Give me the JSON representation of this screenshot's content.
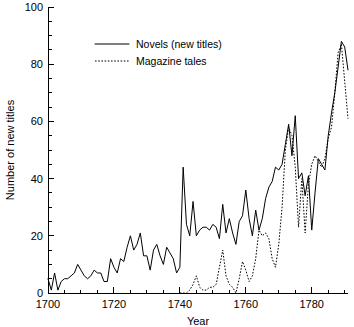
{
  "chart_data": {
    "type": "line",
    "title": "",
    "xlabel": "Year",
    "ylabel": "Number of new titles",
    "xlim": [
      1700,
      1791
    ],
    "ylim": [
      0,
      100
    ],
    "grid": false,
    "legend_position": "top-left-inside",
    "x_major_ticks": [
      1700,
      1720,
      1740,
      1760,
      1780
    ],
    "x_major_tick_labels": [
      "1700",
      "1720",
      "1740",
      "1760",
      "1780"
    ],
    "x_minor_tick_step": 5,
    "y_major_ticks": [
      0,
      20,
      40,
      60,
      80,
      100
    ],
    "y_major_tick_labels": [
      "0",
      "20",
      "40",
      "60",
      "80",
      "100"
    ],
    "y_minor_tick_step": 5,
    "series": [
      {
        "name": "Novels (new titles)",
        "style": "solid",
        "color": "#000000",
        "x": [
          1700,
          1701,
          1702,
          1703,
          1704,
          1705,
          1706,
          1707,
          1708,
          1709,
          1710,
          1711,
          1712,
          1713,
          1714,
          1715,
          1716,
          1717,
          1718,
          1719,
          1720,
          1721,
          1722,
          1723,
          1724,
          1725,
          1726,
          1727,
          1728,
          1729,
          1730,
          1731,
          1732,
          1733,
          1734,
          1735,
          1736,
          1737,
          1738,
          1739,
          1740,
          1741,
          1742,
          1743,
          1744,
          1745,
          1746,
          1747,
          1748,
          1749,
          1750,
          1751,
          1752,
          1753,
          1754,
          1755,
          1756,
          1757,
          1758,
          1759,
          1760,
          1761,
          1762,
          1763,
          1764,
          1765,
          1766,
          1767,
          1768,
          1769,
          1770,
          1771,
          1772,
          1773,
          1774,
          1775,
          1776,
          1777,
          1778,
          1779,
          1780,
          1781,
          1782,
          1783,
          1784,
          1785,
          1786,
          1787,
          1788,
          1789,
          1790,
          1791
        ],
        "values": [
          5,
          1,
          7,
          1,
          4,
          5,
          5,
          6,
          7,
          10,
          8,
          6,
          5,
          6,
          8,
          7,
          7,
          4,
          4,
          12,
          9,
          7,
          12,
          11,
          16,
          20,
          15,
          17,
          21,
          13,
          13,
          8,
          15,
          17,
          13,
          10,
          16,
          14,
          12,
          7,
          9,
          44,
          24,
          20,
          32,
          20,
          22,
          23,
          23,
          22,
          24,
          23,
          19,
          31,
          21,
          26,
          21,
          17,
          25,
          27,
          36,
          26,
          20,
          29,
          22,
          26,
          33,
          37,
          39,
          44,
          43,
          45,
          52,
          59,
          48,
          62,
          40,
          42,
          34,
          41,
          22,
          35,
          47,
          45,
          43,
          55,
          63,
          70,
          79,
          88,
          86,
          78
        ]
      },
      {
        "name": "Magazine tales",
        "style": "dotted",
        "color": "#000000",
        "x": [
          1740,
          1741,
          1742,
          1743,
          1744,
          1745,
          1746,
          1747,
          1748,
          1749,
          1750,
          1751,
          1752,
          1753,
          1754,
          1755,
          1756,
          1757,
          1758,
          1759,
          1760,
          1761,
          1762,
          1763,
          1764,
          1765,
          1766,
          1767,
          1768,
          1769,
          1770,
          1771,
          1772,
          1773,
          1774,
          1775,
          1776,
          1777,
          1778,
          1779,
          1780,
          1781,
          1782,
          1783,
          1784,
          1785,
          1786,
          1787,
          1788,
          1789,
          1790,
          1791
        ],
        "values": [
          0,
          0,
          0,
          1,
          3,
          6,
          2,
          1,
          1,
          2,
          2,
          3,
          9,
          15,
          6,
          3,
          2,
          0,
          5,
          11,
          8,
          4,
          6,
          12,
          22,
          20,
          21,
          19,
          12,
          9,
          17,
          30,
          50,
          58,
          55,
          44,
          23,
          40,
          21,
          38,
          45,
          48,
          46,
          44,
          47,
          54,
          58,
          70,
          84,
          87,
          74,
          61
        ]
      }
    ]
  },
  "legend": {
    "entries": [
      {
        "label": "Novels (new titles)",
        "style": "solid"
      },
      {
        "label": "Magazine tales",
        "style": "dotted"
      }
    ]
  }
}
